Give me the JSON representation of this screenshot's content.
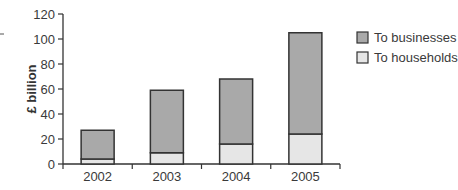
{
  "chart_data": {
    "type": "bar",
    "stacked": true,
    "title": "",
    "xlabel": "",
    "ylabel": "£ billion",
    "ylim": [
      0,
      120
    ],
    "yticks": [
      0,
      20,
      40,
      60,
      80,
      100,
      120
    ],
    "categories": [
      "2002",
      "2003",
      "2004",
      "2005"
    ],
    "series": [
      {
        "name": "To households",
        "values": [
          4,
          9,
          16,
          24
        ],
        "color": "#e6e6e6"
      },
      {
        "name": "To businesses",
        "values": [
          23,
          50,
          52,
          81
        ],
        "color": "#a9a9a9"
      }
    ],
    "totals": [
      27,
      59,
      68,
      105
    ],
    "grid": false,
    "legend_position": "right-top",
    "legend": [
      {
        "label": "To businesses",
        "color": "#a9a9a9"
      },
      {
        "label": "To households",
        "color": "#e6e6e6"
      }
    ]
  },
  "colors": {
    "axis": "#333333",
    "bar_border": "#333333"
  }
}
